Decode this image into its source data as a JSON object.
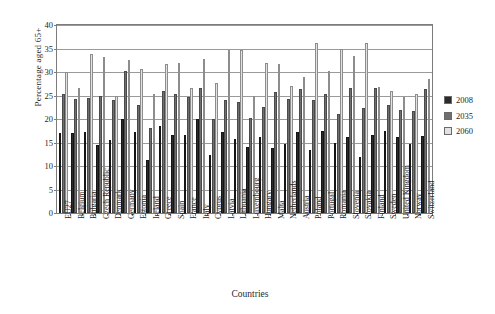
{
  "chart_data": {
    "type": "bar",
    "title": "",
    "xlabel": "Countries",
    "ylabel": "Percentage aged 65+",
    "ylim": [
      0,
      40
    ],
    "yticks": [
      0,
      5,
      10,
      15,
      20,
      25,
      30,
      35,
      40
    ],
    "grid": true,
    "legend_position": "right",
    "categories": [
      "EU27",
      "Belgium",
      "Bulgaria",
      "Czech Republic",
      "Denmark",
      "Germany",
      "Estonia",
      "Ireland",
      "Greece",
      "Spain",
      "France",
      "Italy",
      "Cyprus",
      "Latvia",
      "Lithuania",
      "Luxembourg",
      "Hungary",
      "Malta",
      "Netherlands",
      "Austria",
      "Poland",
      "Portugal",
      "Romania",
      "Slovenia",
      "Slovakia",
      "Finland",
      "Sweden",
      "United Kingdom",
      "Norway",
      "Switzerland"
    ],
    "series": [
      {
        "name": "2008",
        "color": "#2b2b2b",
        "values": [
          17.1,
          17.1,
          17.3,
          14.4,
          15.6,
          20.1,
          17.2,
          11.2,
          18.6,
          16.6,
          16.5,
          20.0,
          12.4,
          17.2,
          15.8,
          14.0,
          16.2,
          13.8,
          14.7,
          17.2,
          13.4,
          17.4,
          14.9,
          16.1,
          12.0,
          16.5,
          17.5,
          16.1,
          14.6,
          16.4
        ]
      },
      {
        "name": "2035",
        "color": "#6f6f6f",
        "values": [
          25.4,
          24.3,
          24.4,
          24.8,
          24.0,
          30.2,
          22.9,
          18.0,
          25.9,
          25.4,
          24.6,
          26.7,
          20.0,
          24.1,
          23.7,
          20.2,
          22.6,
          25.8,
          24.2,
          26.4,
          24.0,
          25.3,
          21.1,
          26.7,
          22.4,
          26.5,
          23.0,
          21.9,
          21.7,
          26.3
        ]
      },
      {
        "name": "2060",
        "color": "#e2e2e2",
        "values": [
          30.0,
          26.5,
          33.9,
          33.3,
          25.0,
          32.5,
          30.7,
          25.3,
          31.6,
          31.9,
          26.6,
          32.7,
          27.7,
          34.6,
          34.7,
          25.0,
          31.9,
          31.8,
          27.0,
          29.0,
          36.2,
          30.2,
          35.0,
          33.4,
          36.1,
          26.9,
          26.0,
          24.7,
          25.3,
          28.5
        ]
      }
    ]
  },
  "legend": {
    "items": [
      {
        "label": "2008",
        "color": "#2b2b2b"
      },
      {
        "label": "2035",
        "color": "#6f6f6f"
      },
      {
        "label": "2060",
        "color": "#e2e2e2"
      }
    ]
  }
}
